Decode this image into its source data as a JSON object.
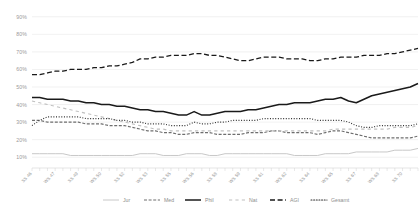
{
  "chart_data": {
    "type": "line",
    "title": "",
    "xlabel": "",
    "ylabel": "",
    "ylim": [
      5,
      95
    ],
    "grid": true,
    "legend_position": "bottom",
    "ytick_labels": [
      "90%",
      "80%",
      "70%",
      "60%",
      "50%",
      "40%",
      "30%",
      "20%",
      "10%"
    ],
    "ytick_values": [
      90,
      80,
      70,
      60,
      50,
      40,
      30,
      20,
      10
    ],
    "categories": [
      "SS 46",
      "WS 46",
      "SS 47",
      "WS 47",
      "SS 48",
      "WS 48",
      "SS 49",
      "WS 49",
      "SS 50",
      "WS 50",
      "SS 51",
      "WS 51",
      "SS 52",
      "WS 52",
      "SS 53",
      "WS 53",
      "SS 54",
      "WS 54",
      "SS 55",
      "WS 55",
      "SS 56",
      "WS 56",
      "SS 57",
      "WS 57",
      "SS 58",
      "WS 58",
      "SS 59",
      "WS 59",
      "SS 60",
      "WS 60",
      "SS 61",
      "WS 61",
      "SS 62",
      "WS 62",
      "SS 63",
      "WS 63",
      "SS 64",
      "WS 64",
      "SS 65",
      "WS 65",
      "SS 66",
      "WS 66",
      "SS 67",
      "WS 67",
      "SS 68",
      "WS 68",
      "SS 69",
      "WS 69",
      "SS 70",
      "WS 70",
      "SS 71"
    ],
    "xtick_labels_shown": [
      "SS 46",
      "SS 48",
      "SS 50",
      "SS 52",
      "SS 53",
      "SS 55",
      "SS 57",
      "SS 58",
      "SS 60",
      "SS 62",
      "SS 63",
      "SS 65",
      "SS 67",
      "SS 68",
      "SS 69",
      "SS 70",
      "SS 71"
    ],
    "series": [
      {
        "name": "Jur",
        "style": "solid",
        "color": "#c8c8c8",
        "width": 1.0,
        "values": [
          12,
          12,
          12,
          12,
          12,
          11,
          11,
          11,
          11,
          11,
          11,
          11,
          11,
          11,
          12,
          12,
          12,
          11,
          11,
          11,
          12,
          12,
          12,
          11,
          11,
          12,
          12,
          12,
          12,
          12,
          12,
          12,
          12,
          12,
          11,
          11,
          11,
          11,
          12,
          12,
          12,
          12,
          13,
          13,
          13,
          13,
          13,
          14,
          14,
          14,
          15
        ]
      },
      {
        "name": "Med",
        "style": "dashed",
        "color": "#6e6e6e",
        "width": 1.1,
        "values": [
          31,
          31,
          30,
          30,
          30,
          30,
          30,
          29,
          29,
          29,
          28,
          28,
          28,
          27,
          26,
          25,
          25,
          24,
          24,
          23,
          23,
          24,
          24,
          24,
          23,
          23,
          23,
          23,
          24,
          24,
          24,
          25,
          25,
          24,
          24,
          24,
          24,
          23,
          24,
          25,
          25,
          24,
          23,
          22,
          21,
          21,
          21,
          21,
          21,
          21,
          22
        ]
      },
      {
        "name": "Phil",
        "style": "solid",
        "color": "#1a1a1a",
        "width": 1.5,
        "values": [
          44,
          44,
          43,
          43,
          43,
          42,
          42,
          41,
          41,
          40,
          40,
          39,
          39,
          38,
          37,
          37,
          36,
          36,
          35,
          34,
          34,
          36,
          34,
          34,
          35,
          36,
          36,
          36,
          37,
          37,
          38,
          39,
          40,
          40,
          41,
          41,
          41,
          42,
          43,
          43,
          44,
          42,
          41,
          43,
          45,
          46,
          47,
          48,
          49,
          50,
          52
        ]
      },
      {
        "name": "Nat",
        "style": "dash-loose",
        "color": "#c0c0c0",
        "width": 1.1,
        "values": [
          42,
          41,
          40,
          39,
          38,
          37,
          36,
          35,
          34,
          33,
          32,
          31,
          30,
          29,
          28,
          27,
          26,
          26,
          25,
          25,
          25,
          25,
          25,
          25,
          25,
          25,
          25,
          25,
          25,
          25,
          25,
          25,
          25,
          25,
          25,
          25,
          25,
          25,
          25,
          26,
          26,
          26,
          26,
          26,
          26,
          26,
          26,
          27,
          27,
          27,
          28
        ]
      },
      {
        "name": "AGI",
        "style": "long-dash",
        "color": "#1a1a1a",
        "width": 1.3,
        "values": [
          57,
          57,
          58,
          59,
          59,
          60,
          60,
          60,
          61,
          61,
          62,
          62,
          63,
          64,
          66,
          66,
          67,
          67,
          68,
          68,
          68,
          69,
          69,
          68,
          68,
          67,
          66,
          65,
          65,
          66,
          67,
          67,
          67,
          66,
          66,
          66,
          65,
          65,
          66,
          66,
          67,
          67,
          67,
          68,
          68,
          68,
          69,
          69,
          70,
          71,
          72
        ]
      },
      {
        "name": "Gesamt",
        "style": "dotted",
        "color": "#2e2e2e",
        "width": 1.1,
        "values": [
          28,
          31,
          33,
          33,
          33,
          33,
          33,
          32,
          32,
          32,
          32,
          31,
          31,
          30,
          30,
          29,
          29,
          29,
          28,
          28,
          28,
          30,
          29,
          29,
          30,
          30,
          31,
          31,
          31,
          31,
          32,
          32,
          32,
          32,
          32,
          32,
          32,
          31,
          31,
          31,
          31,
          30,
          28,
          27,
          27,
          28,
          28,
          28,
          28,
          28,
          29
        ]
      }
    ]
  },
  "legend": {
    "items": [
      {
        "label": "Jur"
      },
      {
        "label": "Med"
      },
      {
        "label": "Phil"
      },
      {
        "label": "Nat"
      },
      {
        "label": "AGI"
      },
      {
        "label": "Gesamt"
      }
    ]
  }
}
